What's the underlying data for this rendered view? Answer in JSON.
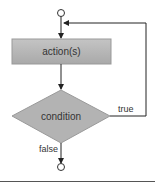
{
  "diagram": {
    "type": "flowchart",
    "nodes": {
      "start": {
        "shape": "circle"
      },
      "action": {
        "shape": "rectangle",
        "label": "action(s)"
      },
      "decision": {
        "shape": "diamond",
        "label": "condition"
      },
      "end": {
        "shape": "circle"
      }
    },
    "edges": {
      "true_label": "true",
      "false_label": "false"
    },
    "colors": {
      "shape_fill": "#b5b5b5",
      "shape_border": "#8f8f8f",
      "line": "#222222",
      "separator": "#555555"
    }
  }
}
